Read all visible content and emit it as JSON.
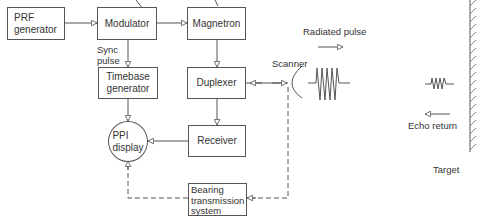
{
  "diagram": {
    "type": "radar-block-diagram",
    "blocks": {
      "prf": "PRF\ngenerator",
      "modulator": "Modulator",
      "magnetron": "Magnetron",
      "timebase": "Timebase\ngenerator",
      "duplexer": "Duplexer",
      "ppi": "PPI\ndisplay",
      "receiver": "Receiver",
      "bearing": "Bearing\ntransmission\nsystem"
    },
    "labels": {
      "sync_pulse": "Sync\npulse",
      "scanner": "Scanner",
      "radiated_pulse": "Radiated pulse",
      "echo_return": "Echo return",
      "target": "Target"
    },
    "connections": [
      {
        "from": "PRF generator",
        "to": "Modulator",
        "style": "solid"
      },
      {
        "from": "Modulator",
        "to": "Magnetron",
        "style": "solid"
      },
      {
        "from": "Modulator",
        "to": "Timebase generator",
        "style": "solid",
        "label": "Sync pulse"
      },
      {
        "from": "Magnetron",
        "to": "Duplexer",
        "style": "solid"
      },
      {
        "from": "Duplexer",
        "to": "Scanner",
        "style": "solid",
        "bidirectional": true
      },
      {
        "from": "Duplexer",
        "to": "Receiver",
        "style": "solid"
      },
      {
        "from": "Timebase generator",
        "to": "PPI display",
        "style": "solid"
      },
      {
        "from": "Receiver",
        "to": "PPI display",
        "style": "solid"
      },
      {
        "from": "Scanner",
        "to": "Bearing transmission system",
        "style": "dashed"
      },
      {
        "from": "Bearing transmission system",
        "to": "PPI display",
        "style": "dashed"
      }
    ],
    "colors": {
      "line": "#555555",
      "text": "#333333",
      "background": "#ffffff"
    }
  }
}
